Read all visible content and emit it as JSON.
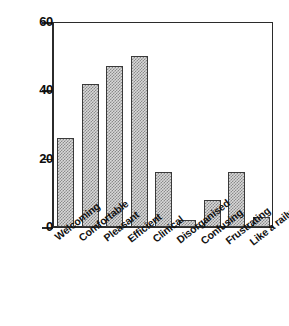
{
  "chart_data": {
    "type": "bar",
    "title": "",
    "xlabel": "",
    "ylabel": "",
    "ylim": [
      0,
      60
    ],
    "yticks": [
      0,
      20,
      40,
      60
    ],
    "grid": false,
    "legend": "none",
    "categories": [
      "Welcoming",
      "Comfortable",
      "Pleasant",
      "Efficient",
      "Clinical",
      "Disorganised",
      "Confusing",
      "Frustrating",
      "Like a railway station"
    ],
    "values": [
      26,
      42,
      47,
      50,
      16,
      2,
      8,
      16,
      3
    ],
    "bar_fill": "#d8d8d8",
    "bar_pattern": "checkerboard",
    "bar_edge_color": "#3a3a3a",
    "axis_color": "#2b2b2b"
  },
  "axis": {
    "y_tick_labels": [
      "60",
      "40",
      "20",
      "0"
    ]
  }
}
